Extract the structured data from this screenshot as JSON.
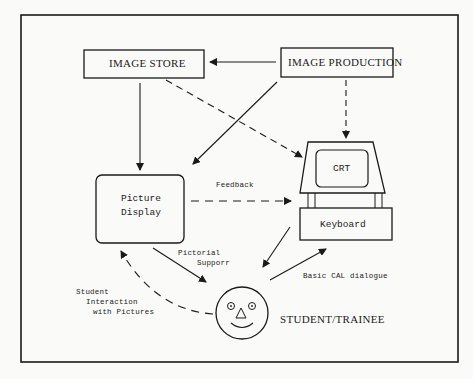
{
  "diagram": {
    "nodes": {
      "image_store": {
        "label": "IMAGE STORE"
      },
      "image_production": {
        "label": "IMAGE PRODUCTION"
      },
      "picture_display": {
        "line1": "Picture",
        "line2": "Display"
      },
      "crt": {
        "label": "CRT"
      },
      "keyboard": {
        "label": "Keyboard"
      },
      "student": {
        "label": "STUDENT/TRAINEE"
      }
    },
    "edges": {
      "feedback": "Feedback",
      "pictorial_support_1": "Pictorial",
      "pictorial_support_2": "Supporr",
      "basic_cal": "Basic CAL dialogue",
      "student_interaction_1": "Student",
      "student_interaction_2": "Interaction",
      "student_interaction_3": "with Pictures"
    },
    "connections": [
      {
        "from": "IMAGE PRODUCTION",
        "to": "IMAGE STORE",
        "style": "solid"
      },
      {
        "from": "IMAGE STORE",
        "to": "Picture Display",
        "style": "solid"
      },
      {
        "from": "IMAGE STORE",
        "to": "CRT",
        "style": "dashed"
      },
      {
        "from": "IMAGE PRODUCTION",
        "to": "Picture Display",
        "style": "solid"
      },
      {
        "from": "IMAGE PRODUCTION",
        "to": "CRT",
        "style": "dashed"
      },
      {
        "from": "Picture Display",
        "to": "CRT",
        "style": "dashed",
        "label": "Feedback"
      },
      {
        "from": "Picture Display",
        "to": "STUDENT/TRAINEE",
        "style": "solid",
        "label": "Pictorial Supporr"
      },
      {
        "from": "Keyboard",
        "to": "STUDENT/TRAINEE",
        "style": "solid"
      },
      {
        "from": "STUDENT/TRAINEE",
        "to": "Keyboard",
        "style": "solid",
        "label": "Basic CAL dialogue"
      },
      {
        "from": "STUDENT/TRAINEE",
        "to": "Picture Display",
        "style": "dashed",
        "label": "Student Interaction with Pictures"
      }
    ]
  }
}
